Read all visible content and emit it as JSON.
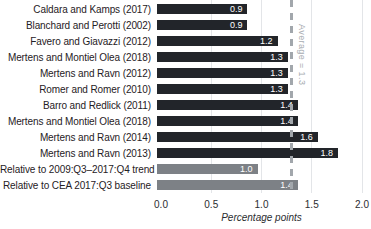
{
  "chart_data": {
    "type": "bar",
    "orientation": "horizontal",
    "title": "",
    "xlabel": "Percentage points",
    "xlim": [
      0,
      2.0
    ],
    "grid": true,
    "xticks": [
      {
        "label": "0.0",
        "value": 0.0
      },
      {
        "label": "0.5",
        "value": 0.5
      },
      {
        "label": "1.0",
        "value": 1.0
      },
      {
        "label": "1.5",
        "value": 1.5
      },
      {
        "label": "2.0",
        "value": 2.0
      }
    ],
    "average_line": {
      "value": 1.3,
      "label": "Average = 1.3"
    },
    "bars": [
      {
        "label": "Caldara and Kamps (2017)",
        "value": 0.9,
        "value_label": "0.9",
        "group": "study"
      },
      {
        "label": "Blanchard and Perotti (2002)",
        "value": 0.9,
        "value_label": "0.9",
        "group": "study"
      },
      {
        "label": "Favero and Giavazzi (2012)",
        "value": 1.2,
        "value_label": "1.2",
        "group": "study"
      },
      {
        "label": "Mertens and Montiel Olea (2018)",
        "value": 1.3,
        "value_label": "1.3",
        "group": "study"
      },
      {
        "label": "Mertens and Ravn (2012)",
        "value": 1.3,
        "value_label": "1.3",
        "group": "study"
      },
      {
        "label": "Romer and Romer (2010)",
        "value": 1.3,
        "value_label": "1.3",
        "group": "study"
      },
      {
        "label": "Barro and Redlick (2011)",
        "value": 1.4,
        "value_label": "1.4",
        "group": "study"
      },
      {
        "label": "Mertens and Montiel Olea (2018)",
        "value": 1.4,
        "value_label": "1.4",
        "group": "study"
      },
      {
        "label": "Mertens and Ravn (2014)",
        "value": 1.6,
        "value_label": "1.6",
        "group": "study"
      },
      {
        "label": "Mertens and Ravn (2013)",
        "value": 1.8,
        "value_label": "1.8",
        "group": "study"
      },
      {
        "label": "Relative to 2009:Q3–2017:Q4 trend",
        "value": 1.0,
        "value_label": "1.0",
        "group": "relative"
      },
      {
        "label": "Relative to CEA 2017:Q3 baseline",
        "value": 1.4,
        "value_label": "1.4",
        "group": "relative"
      }
    ]
  },
  "colors": {
    "bar_study": "#22252a",
    "bar_relative": "#7d8186",
    "average_line": "#a2a7ac",
    "average_text": "#a7acb1",
    "gridline": "#e3e5e8",
    "value_text": "#ffffff",
    "label_text": "#1f2125"
  }
}
